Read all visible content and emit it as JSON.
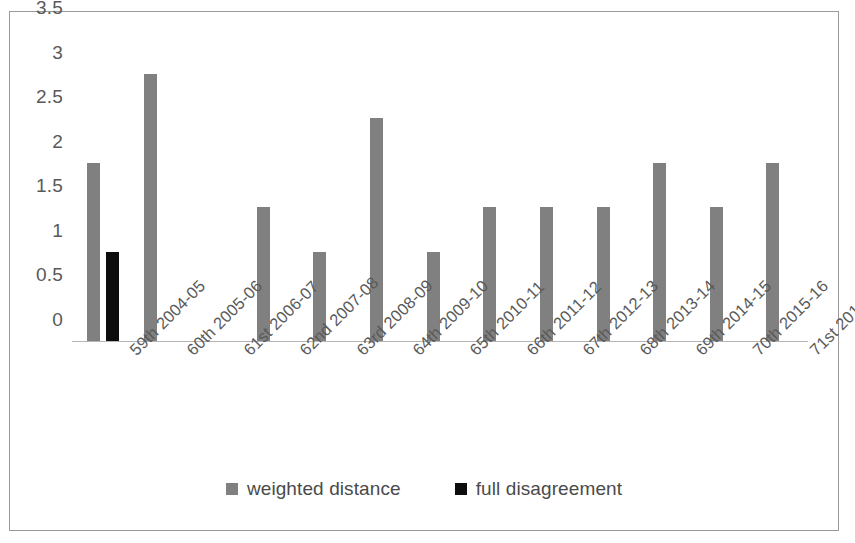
{
  "chart_data": {
    "type": "bar",
    "title": "",
    "xlabel": "",
    "ylabel": "",
    "ylim": [
      0,
      3.5
    ],
    "ytick_step": 0.5,
    "grid": false,
    "legend_position": "bottom",
    "categories": [
      "59th 2004-05",
      "60th 2005-06",
      "61st 2006-07",
      "62nd 2007-08",
      "63rd 2008-09",
      "64th 2009-10",
      "65th 2010-11",
      "66th 2011-12",
      "67th 2012-13",
      "68th 2013-14",
      "69th 2014-15",
      "70th 2015-16",
      "71st 2016-17"
    ],
    "y_ticks": [
      "0",
      "0.5",
      "1",
      "1.5",
      "2",
      "2.5",
      "3",
      "3.5"
    ],
    "series": [
      {
        "name": "weighted distance",
        "color": "#808080",
        "values": [
          2,
          3,
          0,
          1.5,
          1,
          2.5,
          1,
          1.5,
          1.5,
          1.5,
          2,
          1.5,
          2
        ]
      },
      {
        "name": "full disagreement",
        "color": "#0d0d0d",
        "values": [
          1,
          0,
          0,
          0,
          0,
          0,
          0,
          0,
          0,
          0,
          0,
          0,
          0
        ]
      }
    ]
  },
  "legend": {
    "items": [
      {
        "label": "weighted distance",
        "swatch": "weighted"
      },
      {
        "label": "full disagreement",
        "swatch": "full"
      }
    ]
  }
}
